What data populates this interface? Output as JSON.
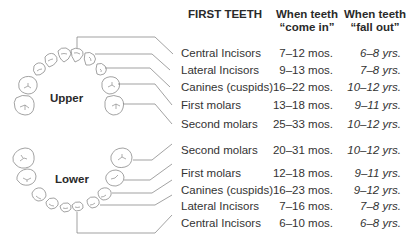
{
  "headers": {
    "first_teeth": "FIRST TEETH",
    "come_in_line1": "When teeth",
    "come_in_line2": "“come in”",
    "fall_out_line1": "When teeth",
    "fall_out_line2": "“fall out”"
  },
  "jaw_labels": {
    "upper": "Upper",
    "lower": "Lower"
  },
  "upper_rows": [
    {
      "tooth": "Central Incisors",
      "come_in": "7–12 mos.",
      "fall_out": "6–8 yrs."
    },
    {
      "tooth": "Lateral Incisors",
      "come_in": "9–13 mos.",
      "fall_out": "7–8 yrs."
    },
    {
      "tooth": "Canines (cuspids)",
      "come_in": "16–22 mos.",
      "fall_out": "10–12 yrs."
    },
    {
      "tooth": "First molars",
      "come_in": "13–18 mos.",
      "fall_out": "9–11 yrs."
    },
    {
      "tooth": "Second molars",
      "come_in": "25–33 mos.",
      "fall_out": "10–12 yrs."
    }
  ],
  "lower_rows": [
    {
      "tooth": "Second molars",
      "come_in": "20–31 mos.",
      "fall_out": "10–12 yrs."
    },
    {
      "tooth": "First molars",
      "come_in": "12–18 mos.",
      "fall_out": "9–11 yrs."
    },
    {
      "tooth": "Canines (cuspids)",
      "come_in": "16–23 mos.",
      "fall_out": "9–12 yrs."
    },
    {
      "tooth": "Lateral Incisors",
      "come_in": "7–16 mos.",
      "fall_out": "7–8 yrs."
    },
    {
      "tooth": "Central Incisors",
      "come_in": "6–10 mos.",
      "fall_out": "6–8 yrs."
    }
  ]
}
